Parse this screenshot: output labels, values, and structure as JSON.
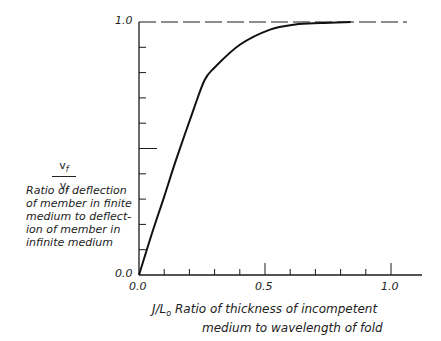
{
  "chart_data": {
    "type": "line",
    "title": "",
    "ylabel_symbol": {
      "numerator": "v",
      "numerator_sub": "f",
      "denominator": "v",
      "denominator_sub": "i"
    },
    "ylabel": "Ratio of deflection of member in finite medium to deflection of member in infinite medium",
    "ylabel_lines": [
      "Ratio of deflection",
      "of member in finite",
      "medium to deflect-",
      "ion of member in",
      "infinite medium"
    ],
    "xlabel_symbol": "J/L",
    "xlabel_symbol_sub": "o",
    "xlabel": "Ratio of thickness of incompetent medium to wavelength of fold",
    "xlabel_lines": [
      "Ratio of thickness of incompetent",
      "medium to wavelength of fold"
    ],
    "x_tick_labels": [
      "0.0",
      "0.5",
      "1.0"
    ],
    "y_tick_labels": [
      "0.0",
      "1.0"
    ],
    "xlim": [
      0.0,
      1.1
    ],
    "ylim": [
      0.0,
      1.0
    ],
    "x_minor_tick_step": 0.1,
    "y_minor_tick_step": 0.1,
    "grid": false,
    "asymptote": {
      "y": 1.0,
      "style": "dashed"
    },
    "series": [
      {
        "name": "v_f / v_i",
        "x": [
          0.0,
          0.05,
          0.1,
          0.147,
          0.215,
          0.26,
          0.3,
          0.4,
          0.52,
          0.62,
          0.72,
          0.84
        ],
        "y": [
          0.0,
          0.16,
          0.31,
          0.455,
          0.65,
          0.77,
          0.82,
          0.91,
          0.97,
          0.99,
          0.996,
          1.0
        ]
      }
    ]
  }
}
